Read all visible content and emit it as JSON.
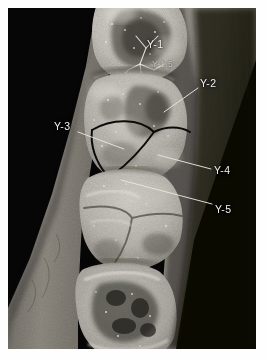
{
  "figure": {
    "kind": "annotated-photograph",
    "color_mode": "grayscale",
    "mount_color": "#fefefe",
    "field_background": "#050505",
    "label_color": "#f2f2ee",
    "trace_color": "#0a0a0a",
    "leader_color": "#e8e6de"
  },
  "annotations": [
    {
      "id": "y1",
      "label": "Y-1",
      "label_x": 139,
      "label_y": 31,
      "leader": "",
      "style": "plain"
    },
    {
      "id": "y15",
      "label": "Y-1.5",
      "label_x": 144,
      "label_y": 52,
      "leader": "",
      "style": "faint"
    },
    {
      "id": "y2",
      "label": "Y-2",
      "label_x": 192,
      "label_y": 70,
      "leader": "M 190 80 L 156 104",
      "style": "plain"
    },
    {
      "id": "y3",
      "label": "Y-3",
      "label_x": 46,
      "label_y": 113,
      "leader": "M 70 124 L 116 141",
      "style": "plain"
    },
    {
      "id": "y4",
      "label": "Y-4",
      "label_x": 206,
      "label_y": 157,
      "leader": "M 203 161 L 150 147",
      "style": "plain"
    },
    {
      "id": "y5",
      "label": "Y-5",
      "label_x": 207,
      "label_y": 196,
      "leader": "M 204 196 L 113 172",
      "style": "plain"
    }
  ],
  "overlay_traces": [
    {
      "id": "y5-groove-pattern",
      "description": "black ink tracing of the Y-5 fissure pattern on the first molar",
      "color": "#0a0a0a"
    }
  ],
  "teeth": [
    {
      "id": "tooth-upper",
      "name": "premolar / anterior crown",
      "center_x": 130,
      "center_y": 32
    },
    {
      "id": "tooth-m1",
      "name": "molar with traced Y pattern",
      "center_x": 128,
      "center_y": 105
    },
    {
      "id": "tooth-m2",
      "name": "second molar",
      "center_x": 123,
      "center_y": 195
    },
    {
      "id": "tooth-m3",
      "name": "third molar",
      "center_x": 116,
      "center_y": 282
    }
  ]
}
